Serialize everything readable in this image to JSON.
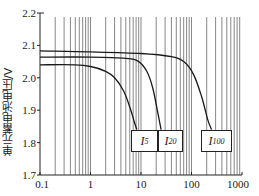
{
  "chart_data": {
    "type": "line",
    "title": "",
    "xlabel": "",
    "ylabel": "单元蓄电池电压/V",
    "xscale": "log",
    "xlim": [
      0.1,
      1000
    ],
    "ylim": [
      1.7,
      2.2
    ],
    "x_ticks": [
      "0.1",
      "1",
      "10",
      "100",
      "1000"
    ],
    "y_ticks": [
      "1.7",
      "1.8",
      "1.9",
      "2.0",
      "2.1",
      "2.2"
    ],
    "grid": {
      "vertical_log_minor": true,
      "horizontal": false
    },
    "legend": "inline boxed labels under curve ends",
    "series": [
      {
        "name": "I5",
        "label_main": "I",
        "label_sub": "5",
        "points": [
          [
            0.1,
            2.04
          ],
          [
            0.5,
            2.04
          ],
          [
            1.0,
            2.035
          ],
          [
            2.0,
            2.02
          ],
          [
            3.0,
            2.0
          ],
          [
            4.5,
            1.96
          ],
          [
            6.0,
            1.91
          ],
          [
            7.5,
            1.86
          ],
          [
            8.3,
            1.84
          ]
        ]
      },
      {
        "name": "I20",
        "label_main": "I",
        "label_sub": "20",
        "points": [
          [
            0.1,
            2.064
          ],
          [
            1.0,
            2.064
          ],
          [
            5.0,
            2.06
          ],
          [
            9.0,
            2.05
          ],
          [
            13.0,
            2.02
          ],
          [
            17.0,
            1.97
          ],
          [
            21.0,
            1.9
          ],
          [
            25.0,
            1.84
          ]
        ]
      },
      {
        "name": "I100",
        "label_main": "I",
        "label_sub": "100",
        "points": [
          [
            0.1,
            2.083
          ],
          [
            1.0,
            2.08
          ],
          [
            10.0,
            2.075
          ],
          [
            40.0,
            2.065
          ],
          [
            70.0,
            2.05
          ],
          [
            110.0,
            2.01
          ],
          [
            160.0,
            1.94
          ],
          [
            210.0,
            1.87
          ],
          [
            250.0,
            1.84
          ]
        ]
      }
    ]
  },
  "colors": {
    "line": "#1a1a1a",
    "grid": "#555555",
    "axis": "#222222"
  }
}
